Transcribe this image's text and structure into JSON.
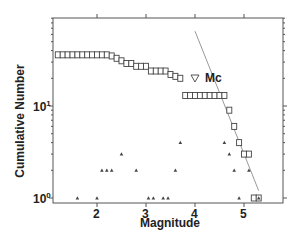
{
  "chart_data": {
    "type": "scatter",
    "title": "",
    "xlabel": "Magnitude",
    "ylabel": "Cumulative Number",
    "xlim": [
      1.1,
      5.8
    ],
    "ylim": [
      0.8,
      90
    ],
    "yscale": "log",
    "x_ticks": [
      2,
      3,
      4,
      5
    ],
    "y_ticks": [
      "10^0",
      "10^1"
    ],
    "grid": false,
    "series": [
      {
        "name": "Cumulative number",
        "marker": "square-open",
        "x": [
          1.2,
          1.3,
          1.4,
          1.5,
          1.6,
          1.7,
          1.8,
          1.9,
          2.0,
          2.1,
          2.2,
          2.3,
          2.4,
          2.5,
          2.6,
          2.7,
          2.8,
          2.9,
          3.0,
          3.1,
          3.2,
          3.3,
          3.4,
          3.5,
          3.6,
          3.7,
          3.8,
          3.9,
          4.0,
          4.1,
          4.2,
          4.3,
          4.4,
          4.5,
          4.6,
          4.7,
          4.8,
          4.9,
          5.0,
          5.1,
          5.2,
          5.3
        ],
        "y": [
          36,
          36,
          36,
          36,
          36,
          36,
          36,
          36,
          36,
          36,
          36,
          35,
          33,
          31,
          29,
          29,
          27,
          27,
          27,
          24,
          24,
          24,
          24,
          22,
          21,
          20,
          13,
          13,
          13,
          13,
          13,
          13,
          13,
          13,
          13,
          9,
          6,
          4,
          3,
          3,
          1,
          1
        ]
      },
      {
        "name": "Non-cumulative number",
        "marker": "triangle-filled",
        "x": [
          1.6,
          2.0,
          2.1,
          2.2,
          2.3,
          2.5,
          2.8,
          3.05,
          3.15,
          3.35,
          3.45,
          3.6,
          3.7,
          4.6,
          4.7,
          4.8,
          4.9,
          5.1,
          5.3
        ],
        "y": [
          1,
          1,
          2,
          2,
          2,
          3,
          2,
          1,
          1,
          1,
          1,
          2,
          4,
          4,
          3,
          2,
          1,
          2,
          1
        ]
      },
      {
        "name": "Mc",
        "marker": "triangle-down-open",
        "x": [
          4.0
        ],
        "y": [
          30
        ]
      },
      {
        "name": "G-R fit",
        "type": "line",
        "x": [
          4.0,
          5.3
        ],
        "y": [
          65,
          1.2
        ]
      }
    ],
    "annotations": [
      {
        "text": "Mc",
        "x": 4.0,
        "y": 30
      }
    ]
  },
  "labels": {
    "xlabel": "Magnitude",
    "ylabel": "Cumulative Number",
    "mc": "Mc",
    "xtick_2": "2",
    "xtick_3": "3",
    "xtick_4": "4",
    "xtick_5": "5",
    "ytick_0_base": "10",
    "ytick_0_exp": "0",
    "ytick_1_base": "10",
    "ytick_1_exp": "1"
  },
  "colors": {
    "axis": "#555555",
    "marker": "#444444",
    "fit_line": "#999999"
  }
}
